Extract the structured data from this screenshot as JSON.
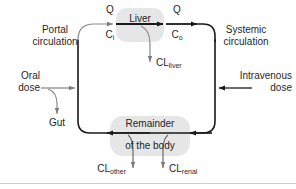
{
  "diagram": {
    "type": "flow-diagram",
    "colors": {
      "line": "#1a1a1a",
      "thin_line": "#6b6b6b",
      "organ_shade": "#e4e4e4",
      "background": "#ffffff"
    },
    "labels": {
      "portal_circulation": "Portal\ncirculation",
      "systemic_circulation": "Systemic\ncirculation",
      "oral_dose": "Oral\ndose",
      "intravenous_dose": "Intravenous\ndose",
      "gut": "Gut",
      "liver": "Liver",
      "remainder_line1": "Remainder",
      "remainder_line2": "of the body",
      "q_in": "Q",
      "q_out": "Q",
      "c_in_main": "C",
      "c_in_sub": "i",
      "c_out_main": "C",
      "c_out_sub": "o",
      "cl_liver_main": "CL",
      "cl_liver_sub": "liver",
      "cl_other_main": "CL",
      "cl_other_sub": "other",
      "cl_renal_main": "CL",
      "cl_renal_sub": "renal"
    }
  }
}
